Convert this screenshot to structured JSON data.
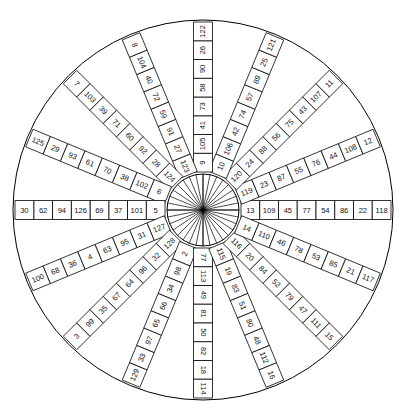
{
  "figure": {
    "name": "circular-number-wheel",
    "shape": "circle",
    "spoke_count": 16,
    "cells_per_spoke": 8,
    "value_range": [
      2,
      129
    ],
    "angle_step_degrees": 22.5,
    "colors": {
      "background": "#ffffff",
      "stroke": "#000000",
      "text": "#111111",
      "cell_fill": "#ffffff"
    },
    "geometry": {
      "center_x": 203,
      "center_y": 210,
      "outer_radius": 190,
      "inner_radius": 36,
      "cell_half_width": 9.5
    }
  },
  "spokes": [
    {
      "id": "spoke-e",
      "angle": 0,
      "label": "east",
      "values": [
        13,
        109,
        45,
        77,
        54,
        86,
        22,
        118
      ]
    },
    {
      "id": "spoke-ene",
      "angle": 22.5,
      "label": "east-northeast",
      "values": [
        119,
        23,
        87,
        55,
        76,
        44,
        108,
        12
      ]
    },
    {
      "id": "spoke-ne",
      "angle": 45,
      "label": "northeast",
      "values": [
        120,
        24,
        88,
        56,
        75,
        43,
        107,
        11
      ]
    },
    {
      "id": "spoke-nne",
      "angle": 67.5,
      "label": "north-northeast",
      "values": [
        10,
        106,
        42,
        74,
        57,
        89,
        25,
        121
      ]
    },
    {
      "id": "spoke-n",
      "angle": 90,
      "label": "north",
      "values": [
        9,
        105,
        41,
        73,
        58,
        90,
        26,
        122
      ]
    },
    {
      "id": "spoke-nnw",
      "angle": 112.5,
      "label": "north-northwest",
      "values": [
        123,
        27,
        91,
        59,
        72,
        40,
        104,
        8
      ]
    },
    {
      "id": "spoke-nw",
      "angle": 135,
      "label": "northwest",
      "values": [
        124,
        28,
        92,
        60,
        71,
        39,
        103,
        7
      ]
    },
    {
      "id": "spoke-wnw",
      "angle": 157.5,
      "label": "west-northwest",
      "values": [
        6,
        102,
        38,
        70,
        61,
        93,
        29,
        125
      ]
    },
    {
      "id": "spoke-w",
      "angle": 180,
      "label": "west",
      "values": [
        5,
        101,
        37,
        69,
        126,
        94,
        62,
        30
      ]
    },
    {
      "id": "spoke-wsw",
      "angle": 202.5,
      "label": "west-southwest",
      "values": [
        127,
        31,
        95,
        63,
        4,
        36,
        68,
        100
      ]
    },
    {
      "id": "spoke-sw",
      "angle": 225,
      "label": "southwest",
      "values": [
        128,
        32,
        96,
        64,
        67,
        35,
        99,
        3
      ]
    },
    {
      "id": "spoke-ssw",
      "angle": 247.5,
      "label": "south-southwest",
      "values": [
        2,
        98,
        34,
        66,
        65,
        97,
        33,
        129
      ]
    },
    {
      "id": "spoke-s",
      "angle": 270,
      "label": "south",
      "values": [
        77,
        113,
        49,
        81,
        50,
        82,
        18,
        114
      ]
    },
    {
      "id": "spoke-sse",
      "angle": 292.5,
      "label": "south-southeast",
      "values": [
        115,
        19,
        83,
        51,
        80,
        48,
        112,
        16
      ]
    },
    {
      "id": "spoke-se",
      "angle": 315,
      "label": "southeast",
      "values": [
        116,
        20,
        84,
        52,
        79,
        47,
        111,
        15
      ]
    },
    {
      "id": "spoke-ese",
      "angle": 337.5,
      "label": "east-southeast",
      "values": [
        14,
        110,
        46,
        78,
        53,
        85,
        21,
        117
      ]
    }
  ]
}
